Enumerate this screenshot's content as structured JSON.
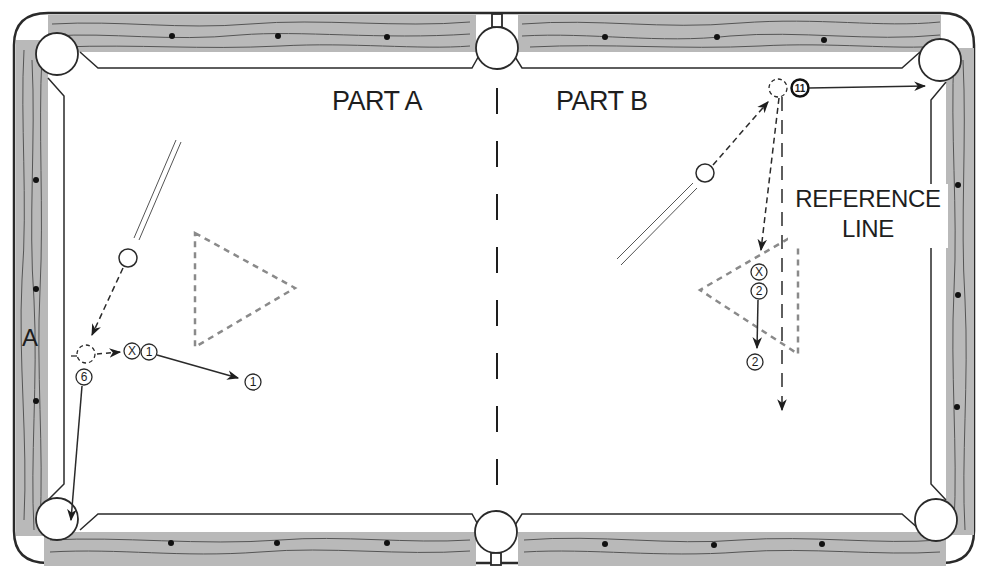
{
  "diagram": {
    "type": "billiards-table-shot-diagram",
    "colors": {
      "rail": "#b9b9b9",
      "grain": "#555555",
      "outline": "#2a2a2a",
      "cloth": "#ffffff",
      "dashed_guide": "#8a8a8a"
    },
    "labels": {
      "part_a": "PART A",
      "part_b": "PART B",
      "reference_line_1": "REFERENCE",
      "reference_line_2": "LINE",
      "rail_marker": "A"
    },
    "balls": {
      "one_start": "1",
      "one_end": "1",
      "six": "6",
      "eleven": "11",
      "two_start": "2",
      "two_end": "2",
      "x_marker_a": "X",
      "x_marker_b": "X"
    },
    "diamonds_per_rail_segment": 3,
    "pockets": 6
  }
}
